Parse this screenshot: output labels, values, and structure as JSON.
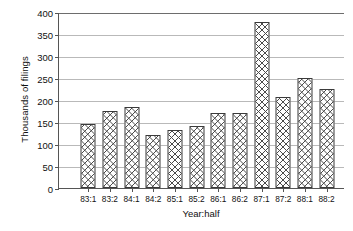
{
  "chart_data": {
    "type": "bar",
    "title": "",
    "xlabel": "Year:half",
    "ylabel": "Thousands of filings",
    "categories": [
      "83:1",
      "83:2",
      "84:1",
      "84:2",
      "85:1",
      "85:2",
      "86:1",
      "86:2",
      "87:1",
      "87:2",
      "88:1",
      "88:2"
    ],
    "values": [
      146,
      176,
      185,
      121,
      131,
      141,
      171,
      171,
      377,
      206,
      251,
      226
    ],
    "ylim": [
      0,
      400
    ],
    "ytick_labels": [
      "0",
      "50",
      "100",
      "150",
      "200",
      "250",
      "300",
      "350",
      "400"
    ],
    "ytick_values": [
      0,
      50,
      100,
      150,
      200,
      250,
      300,
      350,
      400
    ],
    "grid": true,
    "legend": "none",
    "bar_fill": "crosshatch",
    "colors": {
      "bar_edge": "#3a3a3a",
      "bar_fill": "#ffffff",
      "bar_hatch": "#4a4a4a",
      "gridline": "#b9b9b9",
      "axis": "#555555",
      "text": "#111111",
      "background": "#ffffff"
    }
  }
}
